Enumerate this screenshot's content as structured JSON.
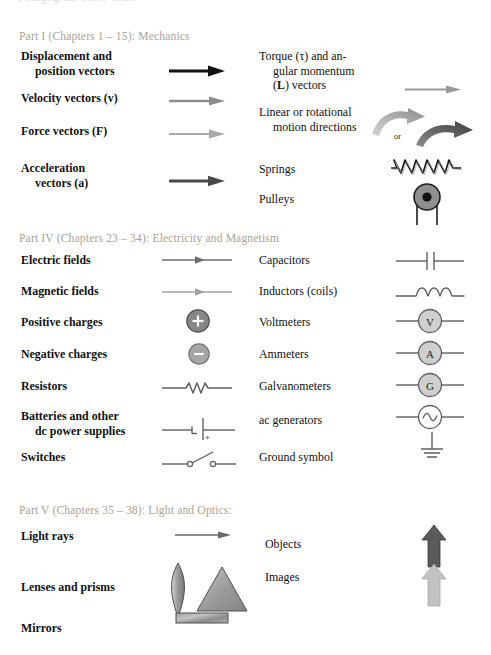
{
  "document": {
    "type": "textbook-symbol-legend",
    "cutoff_top_line": "Pedagogical Color Chart",
    "background": "#ffffff"
  },
  "palette": {
    "header_gray": "#a9a296",
    "text_black": "#111111",
    "arrow_black": "#111111",
    "arrow_midgray": "#8c8c8c",
    "arrow_lightgray": "#a9a9a9",
    "arrow_darkgray": "#4a4a4a",
    "circuit_gray": "#6b6b6b",
    "fill_gray": "#8f8f8f",
    "fill_lightgray": "#bcbcbc",
    "object_arrow": "#5a5a5a",
    "image_arrow": "#b9b9b9"
  },
  "sections": [
    {
      "id": "part-1",
      "heading": "Part I (Chapters 1 – 15): Mechanics",
      "left_items": [
        {
          "id": "displacement",
          "line1": "Displacement and",
          "line2": "position vectors",
          "symbol": "straight-arrow-black"
        },
        {
          "id": "velocity",
          "line1": "Velocity vectors (v)",
          "line2": "",
          "symbol": "straight-arrow-midgray"
        },
        {
          "id": "force",
          "line1": "Force vectors (F)",
          "line2": "",
          "symbol": "straight-arrow-lightgray"
        },
        {
          "id": "acceleration",
          "line1": "Acceleration",
          "line2": "vectors (a)",
          "symbol": "straight-arrow-darkgray"
        }
      ],
      "right_items": [
        {
          "id": "torque",
          "line1": "Torque (τ) and an-",
          "line2": "gular momentum",
          "line3": "(L) vectors",
          "symbol": "straight-arrow-midgray"
        },
        {
          "id": "motion-directions",
          "line1": "Linear or rotational",
          "line2": "motion directions",
          "symbol": "curved-arrows",
          "or_label": "or"
        },
        {
          "id": "springs",
          "line1": "Springs",
          "line2": "",
          "symbol": "spring-coil"
        },
        {
          "id": "pulleys",
          "line1": "Pulleys",
          "line2": "",
          "symbol": "pulley"
        }
      ]
    },
    {
      "id": "part-4",
      "heading": "Part IV (Chapters 23 – 34): Electricity and Magnetism",
      "left_items": [
        {
          "id": "electric-fields",
          "line1": "Electric fields",
          "line2": "",
          "symbol": "field-arrow-dark"
        },
        {
          "id": "magnetic-fields",
          "line1": "Magnetic fields",
          "line2": "",
          "symbol": "field-arrow-light"
        },
        {
          "id": "positive-charges",
          "line1": "Positive charges",
          "line2": "",
          "symbol": "charge-positive",
          "glyph": "+"
        },
        {
          "id": "negative-charges",
          "line1": "Negative charges",
          "line2": "",
          "symbol": "charge-negative",
          "glyph": "–"
        },
        {
          "id": "resistors",
          "line1": "Resistors",
          "line2": "",
          "symbol": "resistor"
        },
        {
          "id": "batteries",
          "line1": "Batteries and other",
          "line2": "dc power supplies",
          "symbol": "battery",
          "plus_sign": "+"
        },
        {
          "id": "switches",
          "line1": "Switches",
          "line2": "",
          "symbol": "switch"
        }
      ],
      "right_items": [
        {
          "id": "capacitors",
          "line1": "Capacitors",
          "line2": "",
          "symbol": "capacitor"
        },
        {
          "id": "inductors",
          "line1": "Inductors (coils)",
          "line2": "",
          "symbol": "inductor"
        },
        {
          "id": "voltmeters",
          "line1": "Voltmeters",
          "line2": "",
          "symbol": "meter-circle",
          "glyph": "V"
        },
        {
          "id": "ammeters",
          "line1": "Ammeters",
          "line2": "",
          "symbol": "meter-circle",
          "glyph": "A"
        },
        {
          "id": "galvanometers",
          "line1": "Galvanometers",
          "line2": "",
          "symbol": "meter-circle",
          "glyph": "G"
        },
        {
          "id": "ac-generators",
          "line1": "ac generators",
          "line2": "",
          "symbol": "ac-generator"
        },
        {
          "id": "ground-symbol",
          "line1": "Ground symbol",
          "line2": "",
          "symbol": "ground"
        }
      ]
    },
    {
      "id": "part-5",
      "heading": "Part V (Chapters 35 – 38): Light and Optics:",
      "left_items": [
        {
          "id": "light-rays",
          "line1": "Light rays",
          "line2": "",
          "symbol": "straight-arrow-darkgray-thin"
        },
        {
          "id": "lenses-prisms",
          "line1": "Lenses and prisms",
          "line2": "",
          "symbol": "lens-prism"
        },
        {
          "id": "mirrors",
          "line1": "Mirrors",
          "line2": "",
          "symbol": "mirror-bar"
        }
      ],
      "right_items": [
        {
          "id": "objects",
          "line1": "Objects",
          "line2": "",
          "symbol": "up-arrow-dark"
        },
        {
          "id": "images",
          "line1": "Images",
          "line2": "",
          "symbol": "up-arrow-light"
        }
      ]
    }
  ]
}
